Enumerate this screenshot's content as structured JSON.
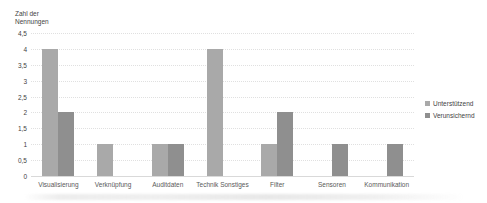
{
  "chart_data": {
    "type": "bar",
    "title": "",
    "ylabel": "Zahl der Nennungen",
    "ylabel_lines": [
      "Zahl der",
      "Nennungen"
    ],
    "xlabel": "",
    "categories": [
      "Visualisierung",
      "Verknüpfung",
      "Auditdaten",
      "Technik Sonstiges",
      "Filter",
      "Sensoren",
      "Kommunikation"
    ],
    "series": [
      {
        "name": "Unterstützend",
        "color": "#a9a9a9",
        "values": [
          4,
          1,
          1,
          4,
          1,
          0,
          0
        ]
      },
      {
        "name": "Verunsichernd",
        "color": "#8f8f8f",
        "values": [
          2,
          0,
          1,
          0,
          2,
          1,
          1
        ]
      }
    ],
    "y_ticks": [
      "4,5",
      "4",
      "3,5",
      "3",
      "2,5",
      "2",
      "1,5",
      "1",
      "0,5",
      "0"
    ],
    "ylim": [
      0,
      4.5
    ],
    "grid": true,
    "legend_position": "right"
  },
  "colors": {
    "grid": "#e0e0e0",
    "axis_text": "#3f3f3f",
    "category_text": "#595959",
    "background": "#ffffff"
  }
}
